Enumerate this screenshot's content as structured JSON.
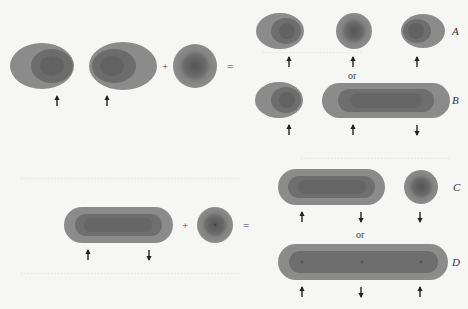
{
  "figure": {
    "colors": {
      "outer": "#8a8a8a",
      "inner": "#6e6e6e",
      "core": "#5e5e5e",
      "arrow": "#222222",
      "background": "#f6f6f4"
    },
    "operators": {
      "plus": "+",
      "equals": "=",
      "or": "or"
    },
    "labels": {
      "A": "A",
      "B": "B",
      "C": "C",
      "D": "D"
    },
    "top_equation": {
      "left_terms": [
        "ellipsoid",
        "ellipsoid",
        "sphere"
      ],
      "arrows": [
        "up",
        "up"
      ],
      "result_A": {
        "shapes": [
          "ellipsoid",
          "sphere",
          "ellipsoid"
        ],
        "arrows": [
          "up",
          "up",
          "up"
        ]
      },
      "result_B": {
        "shapes": [
          "ellipsoid",
          "capsule"
        ],
        "arrows": [
          "up",
          "up",
          "down"
        ]
      }
    },
    "bottom_equation": {
      "left_terms": [
        "capsule",
        "sphere"
      ],
      "arrows": [
        "up",
        "down"
      ],
      "result_C": {
        "shapes": [
          "capsule",
          "sphere"
        ],
        "arrows": [
          "up",
          "down",
          "down"
        ]
      },
      "result_D": {
        "shapes": [
          "long-capsule"
        ],
        "arrows": [
          "up",
          "down",
          "up"
        ]
      }
    }
  }
}
